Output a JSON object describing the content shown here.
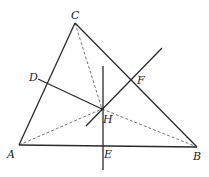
{
  "diagram": {
    "type": "triangle-orthocenter-construction",
    "stroke_color": "#2a2a2a",
    "dash_color": "#555555",
    "points": {
      "A": {
        "x": 19,
        "y": 145,
        "label": "A",
        "lx": 7,
        "ly": 158
      },
      "B": {
        "x": 197,
        "y": 147,
        "label": "B",
        "lx": 193,
        "ly": 160
      },
      "C": {
        "x": 75,
        "y": 23,
        "label": "C",
        "lx": 71,
        "ly": 19
      },
      "D": {
        "x": 38,
        "y": 79,
        "label": "D",
        "lx": 29,
        "ly": 81
      },
      "E": {
        "x": 103,
        "y": 146,
        "label": "E",
        "lx": 104,
        "ly": 158
      },
      "F": {
        "x": 132,
        "y": 80,
        "label": "F",
        "lx": 137,
        "ly": 84
      },
      "H": {
        "x": 102,
        "y": 109,
        "label": "H",
        "lx": 103,
        "ly": 123
      }
    },
    "solid_segments": [
      {
        "name": "side-AC",
        "from": [
          19,
          145
        ],
        "to": [
          75,
          23
        ]
      },
      {
        "name": "side-CB",
        "from": [
          75,
          23
        ],
        "to": [
          197,
          147
        ]
      },
      {
        "name": "side-AB",
        "from": [
          19,
          145
        ],
        "to": [
          197,
          147
        ]
      },
      {
        "name": "perpendicular-E",
        "from": [
          103,
          66
        ],
        "to": [
          103,
          170
        ]
      },
      {
        "name": "perpendicular-D",
        "from": [
          38,
          79
        ],
        "to": [
          102,
          109
        ]
      },
      {
        "name": "perpendicular-F",
        "from": [
          86,
          126
        ],
        "to": [
          162,
          48
        ]
      }
    ],
    "dashed_segments": [
      {
        "name": "dashed-CH",
        "from": [
          75,
          23
        ],
        "to": [
          102,
          109
        ]
      },
      {
        "name": "dashed-AH",
        "from": [
          19,
          145
        ],
        "to": [
          102,
          109
        ]
      },
      {
        "name": "dashed-HB",
        "from": [
          102,
          109
        ],
        "to": [
          197,
          147
        ]
      }
    ]
  }
}
